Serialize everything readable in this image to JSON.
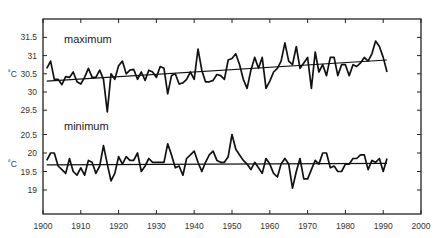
{
  "caption_clipped": "",
  "chart_data": [
    {
      "type": "line",
      "title": "maximum",
      "xlabel": "",
      "ylabel": "˚C",
      "xlim": [
        1900,
        2000
      ],
      "ylim": [
        29.0,
        31.9
      ],
      "yticks": [
        29.5,
        30,
        30.5,
        31,
        31.5
      ],
      "ytick_labels": [
        "29.5",
        "30",
        "30.5",
        "31",
        "31.5"
      ],
      "grid": false,
      "legend": "none",
      "x": [
        1901,
        1902,
        1903,
        1904,
        1905,
        1906,
        1907,
        1908,
        1909,
        1910,
        1911,
        1912,
        1913,
        1914,
        1915,
        1916,
        1917,
        1918,
        1919,
        1920,
        1921,
        1922,
        1923,
        1924,
        1925,
        1926,
        1927,
        1928,
        1929,
        1930,
        1931,
        1932,
        1933,
        1934,
        1935,
        1936,
        1937,
        1938,
        1939,
        1940,
        1941,
        1942,
        1943,
        1944,
        1945,
        1946,
        1947,
        1948,
        1949,
        1950,
        1951,
        1952,
        1953,
        1954,
        1955,
        1956,
        1957,
        1958,
        1959,
        1960,
        1961,
        1962,
        1963,
        1964,
        1965,
        1966,
        1967,
        1968,
        1969,
        1970,
        1971,
        1972,
        1973,
        1974,
        1975,
        1976,
        1977,
        1978,
        1979,
        1980,
        1981,
        1982,
        1983,
        1984,
        1985,
        1986,
        1987,
        1988,
        1989,
        1990,
        1991
      ],
      "series": [
        {
          "name": "maximum",
          "values": [
            30.65,
            30.85,
            30.35,
            30.35,
            30.2,
            30.42,
            30.4,
            30.55,
            30.28,
            30.22,
            30.4,
            30.65,
            30.4,
            30.4,
            30.6,
            30.35,
            29.45,
            30.5,
            30.35,
            30.72,
            30.85,
            30.5,
            30.6,
            30.62,
            30.35,
            30.55,
            30.32,
            30.6,
            30.55,
            30.4,
            30.7,
            30.65,
            29.95,
            30.45,
            30.5,
            30.22,
            30.25,
            30.35,
            30.55,
            30.35,
            31.18,
            30.6,
            30.28,
            30.28,
            30.32,
            30.48,
            30.45,
            30.35,
            30.88,
            30.92,
            31.05,
            30.75,
            30.35,
            30.1,
            30.6,
            30.95,
            30.65,
            30.95,
            30.1,
            30.3,
            30.55,
            30.65,
            30.85,
            31.35,
            30.85,
            30.75,
            31.25,
            30.65,
            30.8,
            30.95,
            30.1,
            31.1,
            30.55,
            30.75,
            30.45,
            30.95,
            30.95,
            30.45,
            30.75,
            30.75,
            30.45,
            30.75,
            30.7,
            30.8,
            30.95,
            30.85,
            31.05,
            31.4,
            31.25,
            30.95,
            30.55
          ]
        },
        {
          "name": "maximum-trend",
          "values_at_endpoints": {
            "1901": 30.3,
            "1991": 30.88
          }
        }
      ]
    },
    {
      "type": "line",
      "title": "minimum",
      "xlabel": "",
      "ylabel": "˚C",
      "xlim": [
        1900,
        2000
      ],
      "ylim": [
        18.6,
        20.7
      ],
      "yticks": [
        19,
        19.5,
        20,
        20.5
      ],
      "ytick_labels": [
        "19",
        "19.5",
        "20",
        "20.5"
      ],
      "grid": false,
      "legend": "none",
      "x": [
        1901,
        1902,
        1903,
        1904,
        1905,
        1906,
        1907,
        1908,
        1909,
        1910,
        1911,
        1912,
        1913,
        1914,
        1915,
        1916,
        1917,
        1918,
        1919,
        1920,
        1921,
        1922,
        1923,
        1924,
        1925,
        1926,
        1927,
        1928,
        1929,
        1930,
        1931,
        1932,
        1933,
        1934,
        1935,
        1936,
        1937,
        1938,
        1939,
        1940,
        1941,
        1942,
        1943,
        1944,
        1945,
        1946,
        1947,
        1948,
        1949,
        1950,
        1951,
        1952,
        1953,
        1954,
        1955,
        1956,
        1957,
        1958,
        1959,
        1960,
        1961,
        1962,
        1963,
        1964,
        1965,
        1966,
        1967,
        1968,
        1969,
        1970,
        1971,
        1972,
        1973,
        1974,
        1975,
        1976,
        1977,
        1978,
        1979,
        1980,
        1981,
        1982,
        1983,
        1984,
        1985,
        1986,
        1987,
        1988,
        1989,
        1990,
        1991
      ],
      "series": [
        {
          "name": "minimum",
          "values": [
            19.8,
            20.0,
            20.0,
            19.65,
            19.55,
            19.45,
            19.85,
            19.5,
            19.4,
            19.6,
            19.4,
            19.8,
            19.75,
            19.45,
            19.65,
            20.2,
            19.7,
            19.25,
            19.45,
            19.9,
            19.7,
            19.9,
            19.8,
            19.8,
            20.0,
            19.5,
            19.65,
            19.85,
            19.75,
            19.75,
            19.75,
            19.75,
            20.25,
            19.95,
            19.6,
            19.65,
            19.4,
            19.85,
            19.95,
            20.05,
            19.75,
            19.5,
            19.75,
            19.95,
            20.05,
            19.8,
            19.75,
            19.75,
            19.9,
            20.5,
            20.1,
            19.95,
            19.8,
            19.7,
            19.55,
            19.75,
            19.6,
            19.45,
            19.85,
            19.7,
            19.45,
            19.35,
            19.7,
            19.85,
            19.7,
            19.05,
            19.5,
            19.85,
            19.3,
            19.3,
            19.55,
            19.8,
            19.7,
            20.0,
            20.0,
            19.6,
            19.65,
            19.5,
            19.5,
            19.7,
            19.7,
            19.85,
            19.85,
            19.95,
            19.95,
            19.55,
            19.8,
            19.75,
            19.85,
            19.5,
            19.85
          ],
          "values_note": "approximate readings"
        },
        {
          "name": "minimum-trend",
          "values_at_endpoints": {
            "1901": 19.68,
            "1991": 19.72
          }
        }
      ]
    }
  ],
  "x_axis": {
    "ticks": [
      1900,
      1910,
      1920,
      1930,
      1940,
      1950,
      1960,
      1970,
      1980,
      1990,
      2000
    ],
    "tick_labels": [
      "1900",
      "1910",
      "1920",
      "1930",
      "1940",
      "1950",
      "1960",
      "1970",
      "1980",
      "1990",
      "2000"
    ]
  },
  "labels": {
    "max_title": "maximum",
    "min_title": "minimum",
    "unit": "˚C"
  },
  "colors": {
    "line": "#111111",
    "axis": "#222222",
    "text": "#333333",
    "background": "#ffffff"
  }
}
